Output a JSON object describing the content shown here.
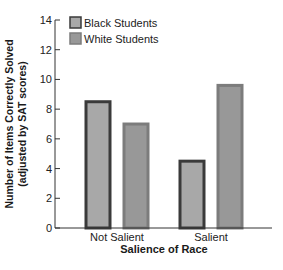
{
  "chart_data": {
    "type": "bar",
    "title": "",
    "xlabel": "Salience of Race",
    "ylabel_line1": "Number of Items Correctly Solved",
    "ylabel_line2": "(adjusted by SAT scores)",
    "ylim": [
      0,
      14
    ],
    "yticks": [
      0,
      2,
      4,
      6,
      8,
      10,
      12,
      14
    ],
    "categories": [
      "Not Salient",
      "Salient"
    ],
    "series": [
      {
        "name": "Black Students",
        "values": [
          8.6,
          4.6
        ],
        "fill": "#a8a8a8",
        "stroke": "#3a3a3a"
      },
      {
        "name": "White Students",
        "values": [
          7.1,
          9.7
        ],
        "fill": "#989898",
        "stroke": "#7c7c7c"
      }
    ],
    "grid": false,
    "legend_position": "top-left inside"
  }
}
